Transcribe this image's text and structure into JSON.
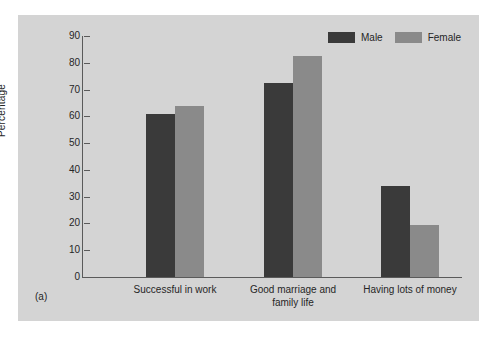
{
  "figure": {
    "caption": "(a)",
    "background_color": "#d4d4d4",
    "page_color": "#ffffff"
  },
  "legend": {
    "position": "top-right",
    "entries": [
      {
        "label": "Male",
        "color": "#3a3a3a",
        "swatch_name": "legend-swatch-male"
      },
      {
        "label": "Female",
        "color": "#8a8a8a",
        "swatch_name": "legend-swatch-female"
      }
    ]
  },
  "chart_data": {
    "type": "bar",
    "title": "",
    "subtitle": "",
    "xlabel": "",
    "ylabel": "Percentage",
    "ylim": [
      0,
      90
    ],
    "ytick_step": 10,
    "yticks": [
      90,
      80,
      70,
      60,
      50,
      40,
      30,
      20,
      10,
      0
    ],
    "ytick_labels": [
      "90",
      "80",
      "70",
      "60",
      "50",
      "40",
      "30",
      "20",
      "10",
      "0"
    ],
    "grid": false,
    "categories": [
      "Successful in work",
      "Good marriage and\nfamily life",
      "Having lots of money"
    ],
    "series": [
      {
        "name": "Male",
        "color": "#3a3a3a",
        "values": [
          61,
          72.5,
          34
        ]
      },
      {
        "name": "Female",
        "color": "#8a8a8a",
        "values": [
          64,
          82.5,
          19.5
        ]
      }
    ],
    "legend_position": "top-right",
    "annotations": []
  },
  "layout": {
    "plot_left": 64,
    "plot_top": 21,
    "plot_width": 380,
    "plot_height": 241,
    "bar_width": 29,
    "group_centers": [
      93,
      211,
      328
    ]
  }
}
